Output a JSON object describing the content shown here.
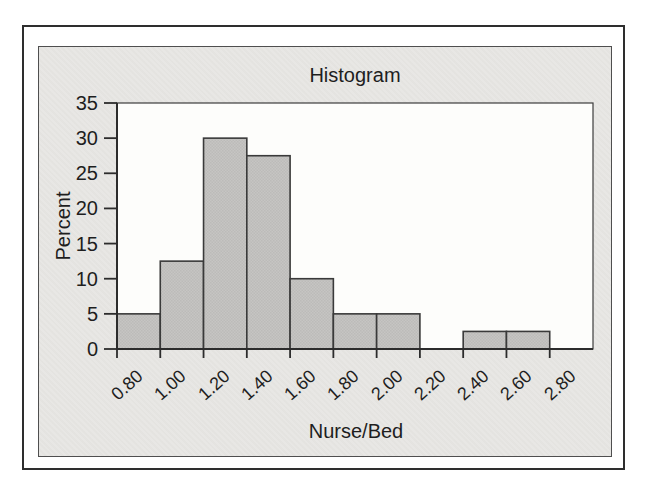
{
  "figure": {
    "kind": "scanned textbook chart"
  },
  "chart_data": {
    "type": "bar",
    "subtype": "histogram",
    "title": "Histogram",
    "xlabel": "Nurse/Bed",
    "ylabel": "Percent",
    "bin_start": 0.8,
    "bin_width": 0.2,
    "bin_ranges": [
      [
        0.8,
        1.0
      ],
      [
        1.0,
        1.2
      ],
      [
        1.2,
        1.4
      ],
      [
        1.4,
        1.6
      ],
      [
        1.6,
        1.8
      ],
      [
        1.8,
        2.0
      ],
      [
        2.0,
        2.2
      ],
      [
        2.2,
        2.4
      ],
      [
        2.4,
        2.6
      ],
      [
        2.6,
        2.8
      ]
    ],
    "values": [
      5,
      12.5,
      30,
      27.5,
      10,
      5,
      5,
      0,
      2.5,
      2.5
    ],
    "x_tick_values": [
      0.8,
      1.0,
      1.2,
      1.4,
      1.6,
      1.8,
      2.0,
      2.2,
      2.4,
      2.6,
      2.8
    ],
    "x_tick_labels": [
      "0.80",
      "1.00",
      "1.20",
      "1.40",
      "1.60",
      "1.80",
      "2.00",
      "2.20",
      "2.40",
      "2.60",
      "2.80"
    ],
    "y_tick_values": [
      0,
      5,
      10,
      15,
      20,
      25,
      30,
      35
    ],
    "y_tick_labels": [
      "0",
      "5",
      "10",
      "15",
      "20",
      "25",
      "30",
      "35"
    ],
    "xlim": [
      0.8,
      3.0
    ],
    "ylim": [
      0,
      35
    ],
    "grid": false,
    "legend": false,
    "x_tick_label_rotation_deg": -42,
    "colors": {
      "bar_fill": "#c6c5c3",
      "bar_fill_alt": "#bcbbb9",
      "bar_stroke": "#3a3a3a",
      "panel_bg": "#e8e7e4",
      "panel_border": "#4f4f4f",
      "plot_bg": "#fdfdfb",
      "plot_border": "#3c3c3c",
      "axis": "#2c2c2c",
      "tick": "#2c2c2c",
      "text": "#1e1e1e",
      "outer_border": "#2e2e2e"
    }
  }
}
